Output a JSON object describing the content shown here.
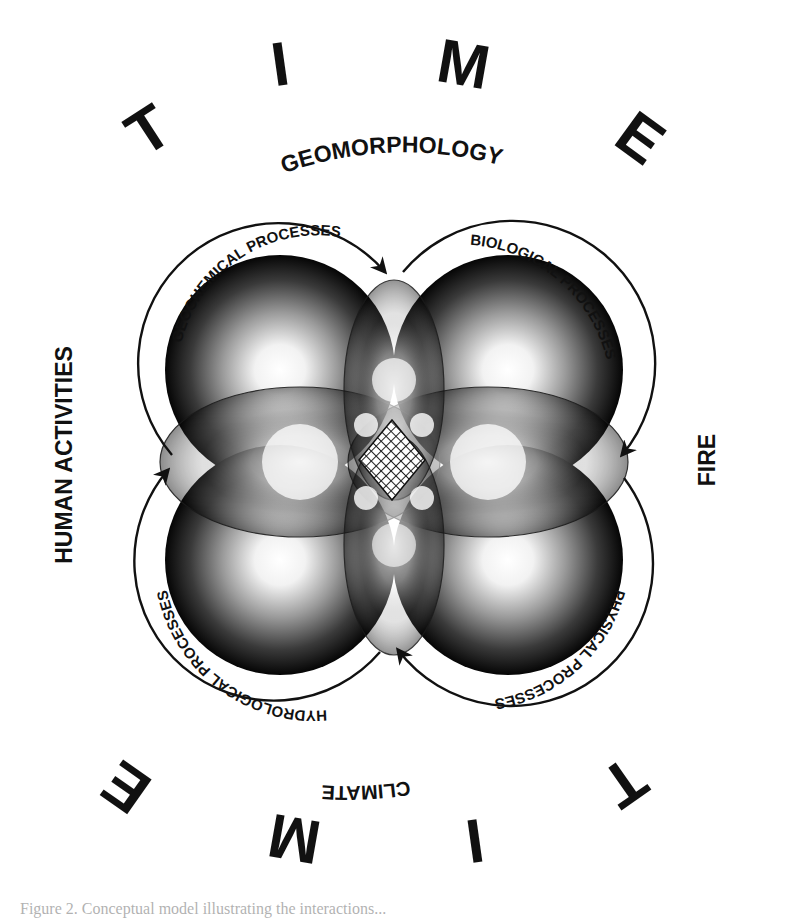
{
  "figure": {
    "type": "conceptual-diagram",
    "outer_word": "TIME",
    "outer_letters_top": [
      "T",
      "I",
      "M",
      "E"
    ],
    "outer_letters_bottom": [
      "E",
      "M",
      "I",
      "T"
    ],
    "drivers": {
      "top": "GEOMORPHOLOGY",
      "left": "HUMAN ACTIVITIES",
      "right": "FIRE",
      "bottom": "CLIMATE"
    },
    "processes": [
      {
        "id": "geochemical",
        "label": "GEOCHEMICAL PROCESSES",
        "position": "top-left"
      },
      {
        "id": "biological",
        "label": "BIOLOGICAL PROCESSES",
        "position": "top-right"
      },
      {
        "id": "physical",
        "label": "PHYSICAL PROCESSES",
        "position": "bottom-right"
      },
      {
        "id": "hydrological",
        "label": "HYDROLOGICAL PROCESSES",
        "position": "bottom-left"
      }
    ],
    "cycle_direction": "clockwise",
    "center": "crosshatched-overlap",
    "colors": {
      "ink": "#111111",
      "shade_dark": "#0a0a0a",
      "shade_light": "#ffffff",
      "background": "#ffffff"
    }
  },
  "caption": {
    "text": "Figure 2. Conceptual model illustrating the interactions..."
  }
}
